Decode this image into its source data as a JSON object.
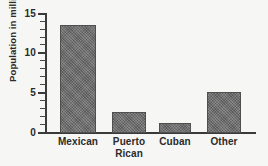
{
  "chart_data": {
    "type": "bar",
    "title": "",
    "xlabel": "",
    "ylabel": "Population in millions",
    "ylim": [
      0,
      15
    ],
    "grid": false,
    "legend": false,
    "categories": [
      "Mexican",
      "Puerto Rican",
      "Cuban",
      "Other"
    ],
    "values": [
      13.6,
      2.7,
      1.2,
      5.2
    ],
    "ytick_labels": [
      "0",
      "5",
      "10",
      "15"
    ],
    "ytick_values": [
      0,
      5,
      10,
      15
    ],
    "yminor_step": 1,
    "bar_color": "#6e6e6e",
    "axis_color": "#3a3a3a",
    "background_color": "#f6f6f4"
  },
  "axis": {
    "y_title": "Population in millions",
    "ticks": [
      {
        "label": "15",
        "value": 15
      },
      {
        "label": "10",
        "value": 10
      },
      {
        "label": "5",
        "value": 5
      },
      {
        "label": "0",
        "value": 0
      }
    ]
  },
  "bars": [
    {
      "label_line1": "Mexican",
      "label_line2": "",
      "value": 13.6
    },
    {
      "label_line1": "Puerto",
      "label_line2": "Rican",
      "value": 2.7
    },
    {
      "label_line1": "Cuban",
      "label_line2": "",
      "value": 1.2
    },
    {
      "label_line1": "Other",
      "label_line2": "",
      "value": 5.2
    }
  ],
  "cropped_title_text": ""
}
